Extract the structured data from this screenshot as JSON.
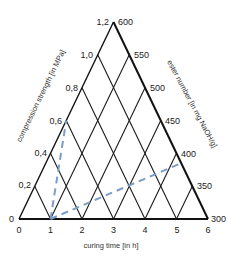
{
  "diagram": {
    "type": "ternary",
    "colors": {
      "grid": "#1a1a1a",
      "frame": "#111111",
      "path": "#7a9cc6",
      "text": "#222222"
    },
    "axes": {
      "bottom": {
        "title": "curing time [in h]",
        "ticks": [
          "0",
          "1",
          "2",
          "3",
          "4",
          "5",
          "6"
        ]
      },
      "left": {
        "title": "compression strength [in MPa]",
        "ticks": [
          "0",
          "0,2",
          "0,4",
          "0,6",
          "0,8",
          "1,0",
          "1,2"
        ]
      },
      "right": {
        "title": "ester number [in mg NaOH/g]",
        "ticks": [
          "300",
          "350",
          "400",
          "450",
          "500",
          "550",
          "600"
        ]
      }
    },
    "dashed_paths": [
      {
        "name": "path-strength",
        "from": {
          "curing_time": 1,
          "compression_strength": 0
        },
        "to": {
          "compression_strength": 0.6
        }
      },
      {
        "name": "path-ester",
        "from": {
          "curing_time": 1,
          "compression_strength": 0
        },
        "to": {
          "ester_number": 385
        }
      }
    ]
  }
}
